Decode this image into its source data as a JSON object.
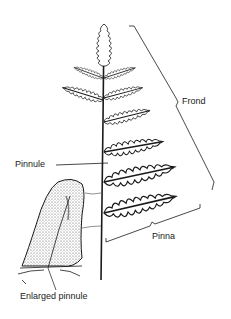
{
  "diagram": {
    "labels": {
      "frond": "Frond",
      "pinnule": "Pinnule",
      "pinna": "Pinna",
      "enlarged_pinnule": "Enlarged pinnule"
    },
    "colors": {
      "ink": "#1a1a1a",
      "background": "#ffffff",
      "shade": "#8a8a8a"
    }
  }
}
